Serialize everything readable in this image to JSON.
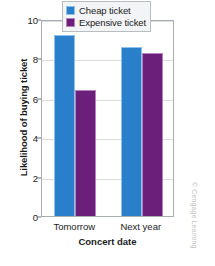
{
  "chart_data": {
    "type": "bar",
    "title": "",
    "subtitle": "",
    "categories": [
      "Tomorrow",
      "Next year"
    ],
    "series": [
      {
        "name": "Cheap ticket",
        "color": "#2a7fcb",
        "values": [
          9.2,
          8.6
        ]
      },
      {
        "name": "Expensive ticket",
        "color": "#6b1f7a",
        "values": [
          6.4,
          8.25
        ]
      }
    ],
    "xlabel": "Concert date",
    "ylabel": "Likelihood of buying ticket",
    "ylim": [
      0,
      10
    ],
    "yticks": [
      0,
      2,
      4,
      6,
      8,
      10
    ],
    "ytick_labels": [
      "0",
      "2",
      "4",
      "6",
      "8",
      "10"
    ],
    "grid": true,
    "grid_axis": "y",
    "legend_position": "top-right-inside"
  },
  "credit": "© Cengage Learning",
  "colors": {
    "cheap": "#2a7fcb",
    "expensive": "#6b1f7a",
    "gridline": "#d9dde1",
    "frame": "#a9adb2",
    "text": "#1b1b1b"
  }
}
